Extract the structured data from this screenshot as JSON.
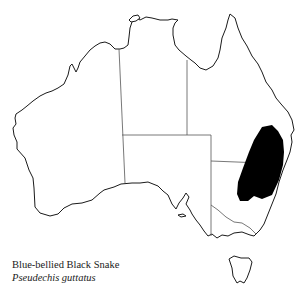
{
  "map": {
    "region": "Australia",
    "outline_color": "#1a1a1a",
    "border_color": "#555555",
    "range_fill": "#000000",
    "range_description": "Eastern Australia (south-east Queensland into New South Wales)"
  },
  "caption": {
    "common_name": "Blue-bellied Black Snake",
    "scientific_name": "Pseudechis guttatus"
  }
}
